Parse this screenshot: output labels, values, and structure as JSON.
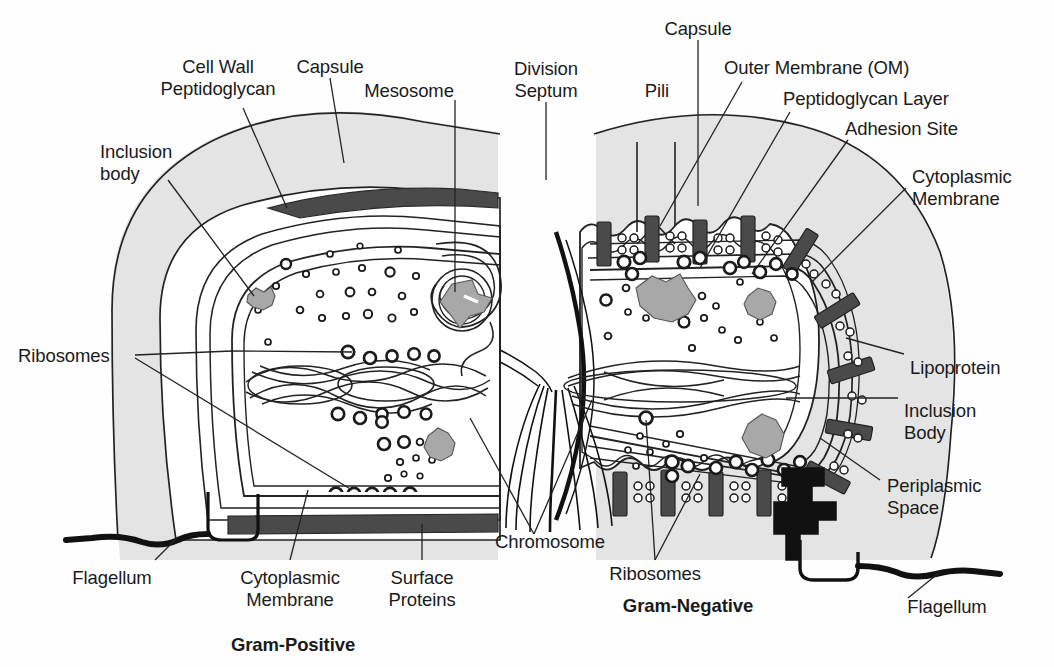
{
  "figure": {
    "type": "biological-diagram"
  },
  "panels": {
    "left": {
      "caption": "Gram-Positive"
    },
    "right": {
      "caption": "Gram-Negative"
    }
  },
  "labels": {
    "cell_wall_peptidoglycan": "Cell Wall\nPeptidoglycan",
    "capsule_left": "Capsule",
    "mesosome": "Mesosome",
    "inclusion_body_left": "Inclusion\nbody",
    "ribosomes_left": "Ribosomes",
    "flagellum_left": "Flagellum",
    "cytoplasmic_membrane_left": "Cytoplasmic\nMembrane",
    "surface_proteins": "Surface\nProteins",
    "gram_positive": "Gram-Positive",
    "division_septum": "Division\nSeptum",
    "pili": "Pili",
    "capsule_right": "Capsule",
    "outer_membrane": "Outer Membrane (OM)",
    "peptidoglycan_layer": "Peptidoglycan Layer",
    "adhesion_site": "Adhesion Site",
    "cytoplasmic_membrane_right": "Cytoplasmic\nMembrane",
    "lipoprotein": "Lipoprotein",
    "inclusion_body_right": "Inclusion\nBody",
    "periplasmic_space": "Periplasmic\nSpace",
    "chromosome": "Chromosome",
    "ribosomes_right": "Ribosomes",
    "flagellum_right": "Flagellum",
    "gram_negative": "Gram-Negative"
  },
  "colors": {
    "ink": "#1a1a1a",
    "stroke": "#222222",
    "capsule_fill": "#e2e2e2",
    "membrane_dark": "#4a4a4a",
    "inclusion_fill": "#a8a8a8",
    "background": "#fefefe",
    "flagellum": "#111111"
  }
}
